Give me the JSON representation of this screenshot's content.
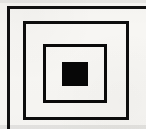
{
  "figure": {
    "background_color": "#f7f6f3",
    "ink_color": "#0a0a0a",
    "canvas": {
      "width": 146,
      "height": 129
    },
    "shape_count": 4,
    "shapes": [
      {
        "name": "outer-rectangle",
        "kind": "rectangle-outline",
        "fill": "none",
        "stroke": "#111111",
        "stroke_width": 3,
        "x": 7,
        "y": 6,
        "width": 145,
        "height": 127,
        "clipped": "right and bottom edges extend past the image boundary",
        "nesting_level": 1
      },
      {
        "name": "middle-rectangle",
        "kind": "rectangle-outline",
        "fill": "none",
        "stroke": "#0d0d0d",
        "stroke_width": 3,
        "x": 23,
        "y": 21,
        "width": 106,
        "height": 99,
        "clipped": "none",
        "nesting_level": 2
      },
      {
        "name": "inner-rectangle",
        "kind": "rectangle-outline",
        "fill": "none",
        "stroke": "#0a0a0a",
        "stroke_width": 3,
        "x": 43,
        "y": 44,
        "width": 64,
        "height": 59,
        "clipped": "none",
        "nesting_level": 3
      },
      {
        "name": "center-solid-square",
        "kind": "rectangle-filled",
        "fill": "#070707",
        "stroke": "none",
        "stroke_width": 0,
        "x": 62,
        "y": 62,
        "width": 26,
        "height": 24,
        "clipped": "none",
        "nesting_level": 4
      }
    ]
  }
}
